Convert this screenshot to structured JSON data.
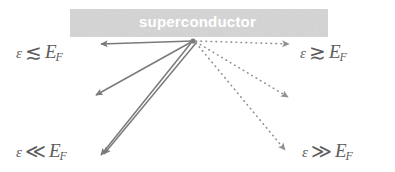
{
  "figure": {
    "background_color": "#ffffff",
    "ink_color": "#6b6b6b",
    "band": {
      "label": "superconductor",
      "label_color": "#ffffff",
      "fill_color": "#e3e3e3",
      "x": 70,
      "y": 9,
      "width": 258,
      "height": 28
    },
    "origin": {
      "x": 193,
      "y": 41
    },
    "labels": [
      {
        "id": "eps-lesssim-ef",
        "name": "label-epsilon-lesssim-ef",
        "epsilon": "ε",
        "relation": "≲",
        "relation_name": "less-than-or-similar",
        "energy": "E",
        "subscript": "F",
        "text": "ε ≲ E_F",
        "x": 16,
        "y": 41
      },
      {
        "id": "eps-gtrsim-ef",
        "name": "label-epsilon-gtrsim-ef",
        "epsilon": "ε",
        "relation": "≳",
        "relation_name": "greater-than-or-similar",
        "energy": "E",
        "subscript": "F",
        "text": "ε ≳ E_F",
        "x": 300,
        "y": 41
      },
      {
        "id": "eps-lll-ef",
        "name": "label-epsilon-much-less-ef",
        "epsilon": "ε",
        "relation": "≪",
        "relation_name": "much-less-than",
        "energy": "E",
        "subscript": "F",
        "text": "ε ≪ E_F",
        "x": 16,
        "y": 140
      },
      {
        "id": "eps-ggg-ef",
        "name": "label-epsilon-much-greater-ef",
        "epsilon": "ε",
        "relation": "≫",
        "relation_name": "much-greater-than",
        "energy": "E",
        "subscript": "F",
        "text": "ε ≫ E_F",
        "x": 302,
        "y": 140
      }
    ],
    "arrows": [
      {
        "name": "arrow-solid-left-horizontal",
        "style": "solid",
        "from": {
          "x": 193,
          "y": 41
        },
        "to": {
          "x": 101,
          "y": 44
        }
      },
      {
        "name": "arrow-solid-left-diagonal",
        "style": "solid",
        "from": {
          "x": 193,
          "y": 41
        },
        "to": {
          "x": 96,
          "y": 95
        }
      },
      {
        "name": "arrow-solid-lower-left-a",
        "style": "solid",
        "from": {
          "x": 191,
          "y": 43
        },
        "to": {
          "x": 101,
          "y": 155
        }
      },
      {
        "name": "arrow-solid-lower-left-b",
        "style": "solid",
        "from": {
          "x": 196,
          "y": 43
        },
        "to": {
          "x": 104,
          "y": 154
        }
      },
      {
        "name": "arrow-dotted-right-horizontal",
        "style": "dotted",
        "from": {
          "x": 196,
          "y": 41
        },
        "to": {
          "x": 289,
          "y": 44
        }
      },
      {
        "name": "arrow-dotted-right-diagonal",
        "style": "dotted",
        "from": {
          "x": 196,
          "y": 42
        },
        "to": {
          "x": 288,
          "y": 97
        }
      },
      {
        "name": "arrow-dotted-lower-right",
        "style": "dotted",
        "from": {
          "x": 196,
          "y": 43
        },
        "to": {
          "x": 285,
          "y": 150
        }
      }
    ]
  }
}
